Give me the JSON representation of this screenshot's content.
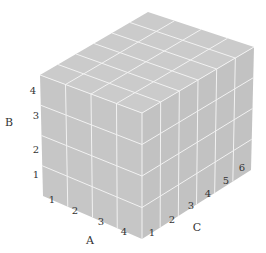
{
  "diagram": {
    "type": "3d-grid-cuboid",
    "dimensions": {
      "A": 4,
      "B": 4,
      "C": 6
    },
    "colors": {
      "face": "#c6c6c6",
      "top": "#cbcbcb",
      "right": "#c2c2c2",
      "grid": "#f2f2f2",
      "text": "#333333"
    },
    "vertices": {
      "top_back": [
        148,
        12
      ],
      "top_right": [
        254,
        47
      ],
      "front_left_top": [
        40,
        75
      ],
      "front_top": [
        142,
        113
      ],
      "front_left_bottom": [
        43,
        196
      ],
      "front_bottom": [
        142,
        239
      ],
      "right_bottom": [
        251,
        170
      ]
    },
    "axes": {
      "A": {
        "label": "A",
        "label_pos": [
          90,
          244
        ],
        "ticks": [
          {
            "text": "1",
            "pos": [
              52,
              203
            ]
          },
          {
            "text": "2",
            "pos": [
              75,
              214
            ]
          },
          {
            "text": "3",
            "pos": [
              101,
              225
            ]
          },
          {
            "text": "4",
            "pos": [
              124,
              235
            ]
          }
        ]
      },
      "B": {
        "label": "B",
        "label_pos": [
          9,
          126
        ],
        "ticks": [
          {
            "text": "1",
            "pos": [
              36,
              178
            ]
          },
          {
            "text": "2",
            "pos": [
              36,
              153
            ]
          },
          {
            "text": "3",
            "pos": [
              36,
              119
            ]
          },
          {
            "text": "4",
            "pos": [
              33,
              94
            ]
          }
        ]
      },
      "C": {
        "label": "C",
        "label_pos": [
          197,
          231
        ],
        "ticks": [
          {
            "text": "1",
            "pos": [
              152,
              236
            ]
          },
          {
            "text": "2",
            "pos": [
              172,
              223
            ]
          },
          {
            "text": "3",
            "pos": [
              191,
              209
            ]
          },
          {
            "text": "4",
            "pos": [
              208,
              197
            ]
          },
          {
            "text": "5",
            "pos": [
              226,
              184
            ]
          },
          {
            "text": "6",
            "pos": [
              242,
              171
            ]
          }
        ]
      }
    }
  }
}
